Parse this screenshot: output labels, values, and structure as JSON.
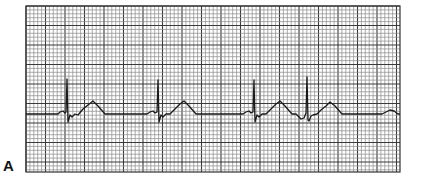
{
  "figure": {
    "panel_label": "A",
    "grid": {
      "x": 26,
      "y": 6,
      "width": 374,
      "height": 166,
      "minor_spacing": 3.9,
      "major_every": 5,
      "minor_color": "#8a8a8a",
      "major_color": "#3a3a3a",
      "border_color": "#333333"
    },
    "trace": {
      "color": "#1a1a1a",
      "baseline_y": 114,
      "points": "26,114 58,114 60,112 63,111 65,113 66,112 67,79 68,122 70,115 72,117 75,114 78,115 83,109 88,105 93,101 98,106 105,114 138,114 147,114 150,112 153,111 155,113 157,112 158,80 159,122 161,115 163,117 166,114 170,114 175,109 180,104 184,101 189,106 196,114 238,114 243,114 246,112 249,111 251,113 253,112 254,80 255,122 257,115 259,117 262,114 266,114 271,109 276,104 280,101 285,106 292,114 296,114 299,117 301,119 304,118 306,113 307,77 308,120 309,121 311,116 313,115 317,114 321,110 326,106 330,102 335,106 342,114 382,114 386,112 390,110 394,111 398,114 400,114"
    }
  }
}
